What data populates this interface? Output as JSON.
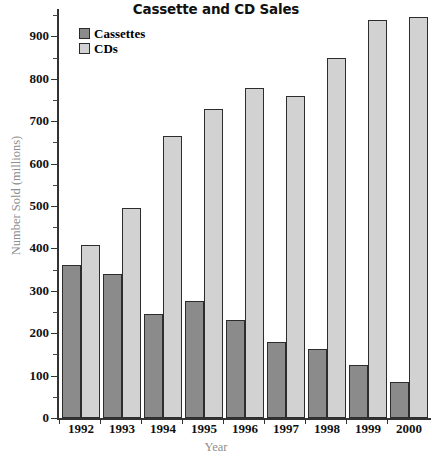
{
  "chart_data": {
    "type": "bar",
    "title": "Cassette and CD Sales",
    "xlabel": "Year",
    "ylabel": "Number Sold (millions)",
    "categories": [
      "1992",
      "1993",
      "1994",
      "1995",
      "1996",
      "1997",
      "1998",
      "1999",
      "2000"
    ],
    "series": [
      {
        "name": "Cassettes",
        "color": "#8b8b8b",
        "values": [
          362,
          340,
          245,
          277,
          232,
          180,
          162,
          125,
          84
        ]
      },
      {
        "name": "CDs",
        "color": "#d2d2d2",
        "values": [
          408,
          496,
          665,
          729,
          779,
          759,
          849,
          938,
          947
        ]
      }
    ],
    "ylim": [
      0,
      960
    ],
    "ytick_labels": [
      "0",
      "100",
      "200",
      "300",
      "400",
      "500",
      "600",
      "700",
      "800",
      "900"
    ],
    "ytick_values": [
      0,
      100,
      200,
      300,
      400,
      500,
      600,
      700,
      800,
      900
    ],
    "yminor_step": 50,
    "grid": false,
    "legend_position": "top-left"
  },
  "legend": {
    "items": [
      {
        "label": "Cassettes",
        "swatch": "#8b8b8b"
      },
      {
        "label": "CDs",
        "swatch": "#d2d2d2"
      }
    ]
  }
}
